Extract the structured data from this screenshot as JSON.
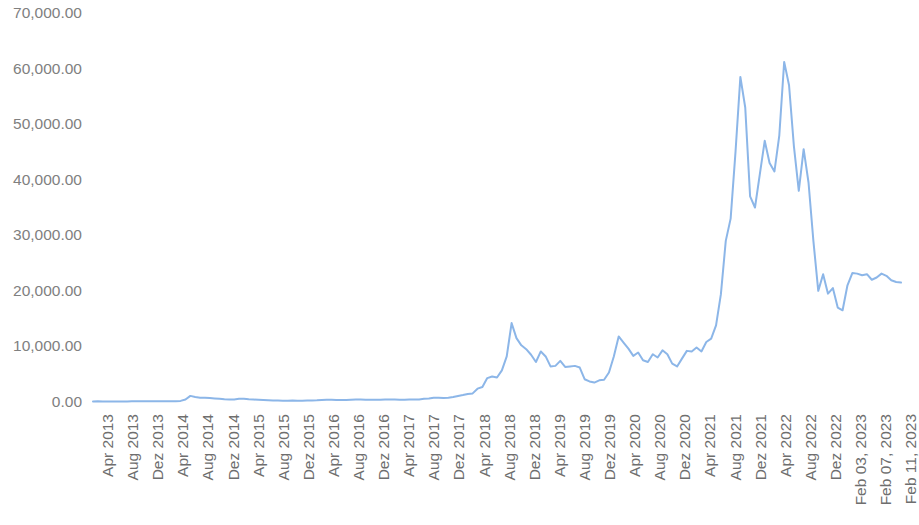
{
  "chart_data": {
    "type": "line",
    "title": "",
    "subtitle": "",
    "xlabel": "",
    "ylabel": "",
    "legend": [],
    "legend_position": "none",
    "grid": false,
    "ylim": [
      0,
      70000
    ],
    "ytick_values": [
      0,
      10000,
      20000,
      30000,
      40000,
      50000,
      60000,
      70000
    ],
    "ytick_labels": [
      "0.00",
      "10,000.00",
      "20,000.00",
      "30,000.00",
      "40,000.00",
      "50,000.00",
      "60,000.00",
      "70,000.00"
    ],
    "xtick_labels": [
      "Apr 2013",
      "Aug 2013",
      "Dez 2013",
      "Apr 2014",
      "Aug 2014",
      "Dez 2014",
      "Apr 2015",
      "Aug 2015",
      "Dez 2015",
      "Apr 2016",
      "Aug 2016",
      "Dez 2016",
      "Apr 2017",
      "Aug 2017",
      "Dez 2017",
      "Apr 2018",
      "Aug 2018",
      "Dez 2018",
      "Apr 2019",
      "Aug 2019",
      "Dez 2019",
      "Apr 2020",
      "Aug 2020",
      "Dez 2020",
      "Apr 2021",
      "Aug 2021",
      "Dez 2021",
      "Apr 2022",
      "Aug 2022",
      "Dez 2022",
      "Feb 03, 2023",
      "Feb 07, 2023",
      "Feb 11, 2023"
    ],
    "line_color": "#8CB6E8",
    "line_width": 2,
    "series": [
      {
        "name": "Price",
        "values": [
          100,
          120,
          105,
          95,
          110,
          100,
          95,
          105,
          120,
          130,
          125,
          135,
          140,
          150,
          145,
          135,
          130,
          140,
          200,
          450,
          1100,
          900,
          780,
          760,
          700,
          650,
          600,
          480,
          450,
          470,
          600,
          580,
          500,
          440,
          390,
          350,
          320,
          290,
          260,
          240,
          230,
          250,
          235,
          245,
          270,
          290,
          320,
          380,
          420,
          400,
          370,
          360,
          380,
          420,
          440,
          430,
          415,
          420,
          410,
          400,
          430,
          450,
          440,
          420,
          415,
          430,
          450,
          470,
          580,
          650,
          780,
          760,
          700,
          750,
          900,
          1080,
          1250,
          1450,
          1550,
          2400,
          2700,
          4300,
          4600,
          4400,
          5700,
          8200,
          14200,
          11500,
          10200,
          9500,
          8500,
          7200,
          9100,
          8200,
          6400,
          6500,
          7400,
          6300,
          6400,
          6500,
          6200,
          4100,
          3700,
          3500,
          3900,
          4000,
          5300,
          8200,
          11800,
          10700,
          9600,
          8300,
          8900,
          7500,
          7200,
          8600,
          8000,
          9300,
          8600,
          6900,
          6400,
          7800,
          9200,
          9100,
          9800,
          9100,
          10800,
          11400,
          13800,
          19400,
          29000,
          33000,
          45000,
          58500,
          53000,
          37000,
          35000,
          41000,
          47000,
          43000,
          41500,
          48000,
          61200,
          57000,
          46000,
          38000,
          45500,
          39500,
          29000,
          20000,
          23000,
          19500,
          20500,
          17000,
          16500,
          21000,
          23200,
          23100,
          22800,
          23000,
          22000,
          22400,
          23100,
          22700,
          21900,
          21600,
          21500
        ]
      }
    ],
    "annotations": {
      "peak_dec_2017": 14200,
      "peak_jun_2019": 11800,
      "peak_apr_2021": 58500,
      "peak_nov_2021": 61200,
      "final_value": 21500
    }
  }
}
